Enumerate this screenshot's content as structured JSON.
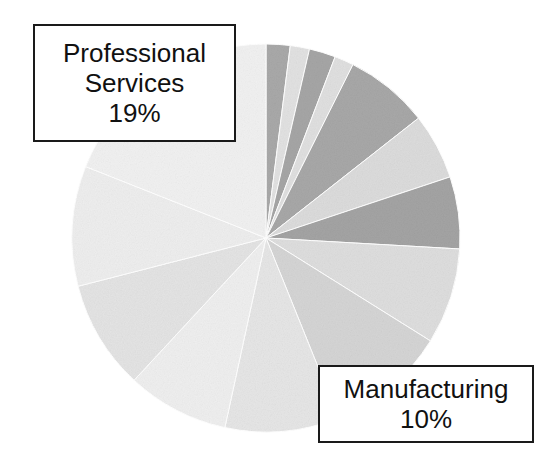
{
  "figure": {
    "background_color": "#ffffff",
    "width": 542,
    "height": 462
  },
  "callouts": [
    {
      "name": "professional-services",
      "lines": [
        "Professional",
        "Services",
        "19%"
      ],
      "label": "Professional Services",
      "value_text": "19%"
    },
    {
      "name": "manufacturing",
      "lines": [
        "Manufacturing",
        "10%"
      ],
      "label": "Manufacturing",
      "value_text": "10%"
    }
  ],
  "chart_data": {
    "type": "pie",
    "title": "",
    "xlabel": "",
    "ylabel": "",
    "legend_position": "none",
    "grid": false,
    "center": [
      266,
      238
    ],
    "radius": 194,
    "start_angle_deg": -90,
    "direction": "clockwise",
    "labels": [
      "Professional Services",
      "Manufacturing"
    ],
    "values": [
      19,
      10
    ],
    "slices": [
      {
        "label": "",
        "value": 2.0,
        "color": "#a9a9a9",
        "labeled": false
      },
      {
        "label": "",
        "value": 1.6,
        "color": "#e2e2e2",
        "labeled": false
      },
      {
        "label": "",
        "value": 2.2,
        "color": "#a6a6a6",
        "labeled": false
      },
      {
        "label": "",
        "value": 1.6,
        "color": "#e0e0e0",
        "labeled": false
      },
      {
        "label": "",
        "value": 7.0,
        "color": "#a8a8a8",
        "labeled": false
      },
      {
        "label": "",
        "value": 5.5,
        "color": "#dcdcdc",
        "labeled": false
      },
      {
        "label": "",
        "value": 6.0,
        "color": "#a4a4a4",
        "labeled": false
      },
      {
        "label": "",
        "value": 8.0,
        "color": "#dedede",
        "labeled": false
      },
      {
        "label": "Manufacturing",
        "value": 10.0,
        "color": "#d5d5d5",
        "labeled": true
      },
      {
        "label": "",
        "value": 9.5,
        "color": "#e6e6e6",
        "labeled": false
      },
      {
        "label": "",
        "value": 8.5,
        "color": "#efefef",
        "labeled": false
      },
      {
        "label": "",
        "value": 9.1,
        "color": "#e4e4e4",
        "labeled": false
      },
      {
        "label": "",
        "value": 10.0,
        "color": "#eeeeee",
        "labeled": false
      },
      {
        "label": "Professional Services",
        "value": 19.0,
        "color": "#f1f1f1",
        "labeled": true
      }
    ],
    "slice_edge_color": "#ffffff",
    "total": 100
  }
}
